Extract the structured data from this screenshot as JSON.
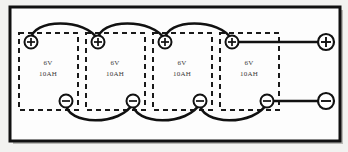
{
  "diagram": {
    "frame": {
      "border_color": "#111111",
      "fill_color": "#fdfdfd",
      "page_background": "#f2f2f0",
      "shadow_color": "#b8b8b4"
    },
    "wire_color": "#111111",
    "box_style": "dashed",
    "box_color": "#1a1a1a",
    "terminal_symbols": {
      "positive": "+",
      "negative": "−",
      "positive_icon": "plus-terminal-icon",
      "negative_icon": "minus-terminal-icon"
    },
    "batteries": [
      {
        "id": "battery-1",
        "voltage": "6V",
        "capacity": "10AH",
        "positive": "+",
        "negative": "−"
      },
      {
        "id": "battery-2",
        "voltage": "6V",
        "capacity": "10AH",
        "positive": "+",
        "negative": "−"
      },
      {
        "id": "battery-3",
        "voltage": "6V",
        "capacity": "10AH",
        "positive": "+",
        "negative": "−"
      },
      {
        "id": "battery-4",
        "voltage": "6V",
        "capacity": "10AH",
        "positive": "+",
        "negative": "−"
      }
    ],
    "output_terminals": {
      "positive": "+",
      "negative": "−"
    }
  }
}
